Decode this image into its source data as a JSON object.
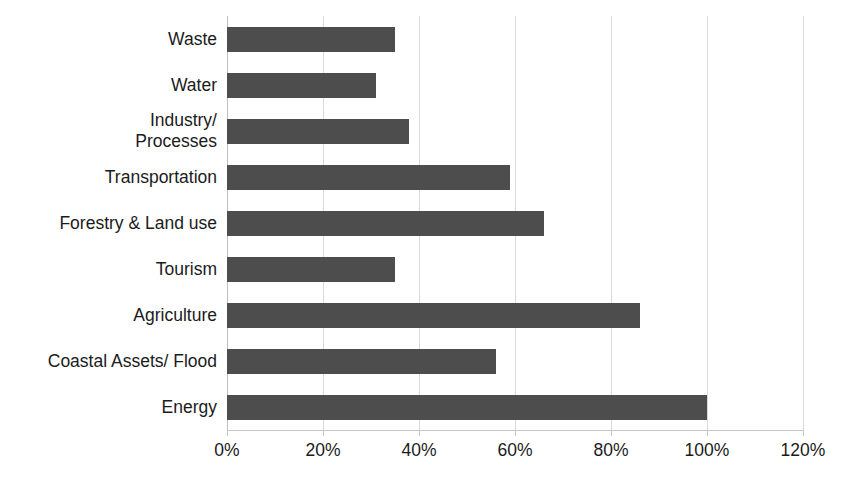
{
  "chart_data": {
    "type": "bar",
    "orientation": "horizontal",
    "title": "",
    "subtitle": "",
    "xlabel": "",
    "ylabel": "",
    "xlim": [
      0,
      120
    ],
    "grid": true,
    "legend": null,
    "bar_color": "#4d4d4d",
    "gridline_color": "#d9d9d9",
    "axis_color": "#c7c7c7",
    "text_color": "#1b1b1b",
    "unit": "%",
    "x_ticks": [
      {
        "value": 0,
        "label": "0%"
      },
      {
        "value": 20,
        "label": "20%"
      },
      {
        "value": 40,
        "label": "40%"
      },
      {
        "value": 60,
        "label": "60%"
      },
      {
        "value": 80,
        "label": "80%"
      },
      {
        "value": 100,
        "label": "100%"
      },
      {
        "value": 120,
        "label": "120%"
      }
    ],
    "categories": [
      "Waste",
      "Water",
      "Industry/\nProcesses",
      "Transportation",
      "Forestry & Land use",
      "Tourism",
      "Agriculture",
      "Coastal Assets/ Flood",
      "Energy"
    ],
    "values": [
      35,
      31,
      38,
      59,
      66,
      35,
      86,
      56,
      100
    ]
  }
}
